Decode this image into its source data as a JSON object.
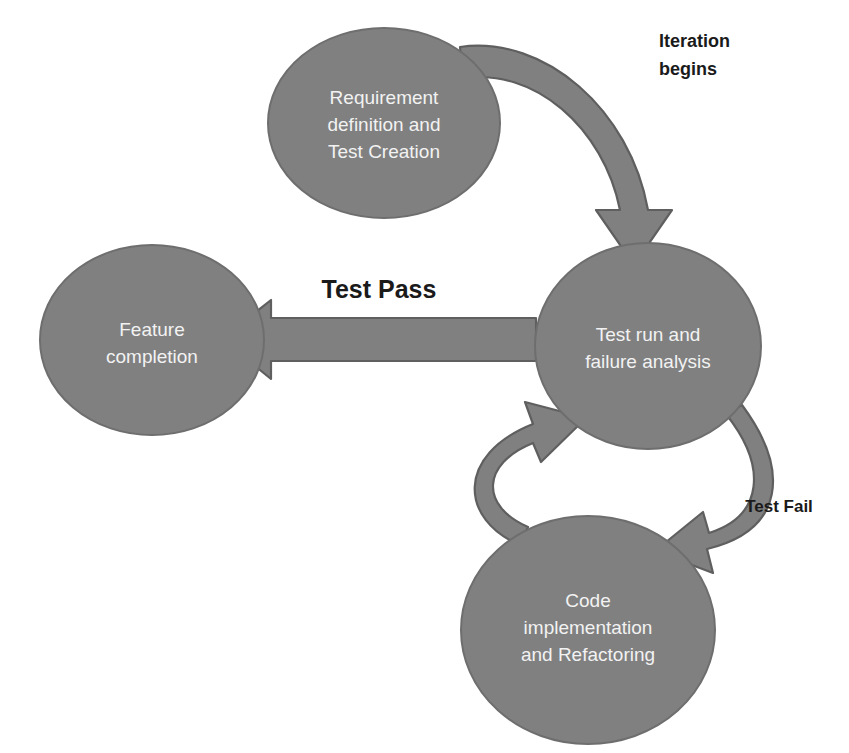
{
  "diagram": {
    "background_color": "#ffffff",
    "node_fill_color": "#808080",
    "node_stroke_color": "#6e6e6e",
    "node_text_color": "#f2f2f2",
    "arrow_fill_color": "#808080",
    "arrow_stroke_color": "#5f5f5f",
    "label_text_color": "#1a1a1a",
    "nodes": [
      {
        "id": "requirement",
        "lines": [
          "Requirement",
          "definition and",
          "Test Creation"
        ],
        "cx": 384,
        "cy": 123,
        "rx": 116,
        "ry": 95
      },
      {
        "id": "test-run",
        "lines": [
          "Test run and",
          "failure analysis"
        ],
        "cx": 648,
        "cy": 346,
        "rx": 113,
        "ry": 103
      },
      {
        "id": "code-implementation",
        "lines": [
          "Code",
          "implementation",
          "and Refactoring"
        ],
        "cx": 588,
        "cy": 630,
        "rx": 127,
        "ry": 114
      },
      {
        "id": "feature-completion",
        "lines": [
          "Feature",
          "completion"
        ],
        "cx": 152,
        "cy": 340,
        "rx": 112,
        "ry": 95
      }
    ],
    "edges": [
      {
        "id": "iteration-begins",
        "label": "Iteration\nbegins",
        "label_lines": [
          "Iteration",
          "begins"
        ],
        "from": "requirement",
        "to": "test-run",
        "shape": "curved"
      },
      {
        "id": "test-pass",
        "label": "Test Pass",
        "from": "test-run",
        "to": "feature-completion",
        "shape": "straight"
      },
      {
        "id": "test-fail",
        "label": "Test Fail",
        "from": "test-run",
        "to": "code-implementation",
        "shape": "curved"
      },
      {
        "id": "retest",
        "label": "",
        "from": "code-implementation",
        "to": "test-run",
        "shape": "curved"
      }
    ],
    "labels": {
      "iteration_begins_line1": "Iteration",
      "iteration_begins_line2": "begins",
      "test_pass": "Test Pass",
      "test_fail": "Test Fail"
    }
  }
}
